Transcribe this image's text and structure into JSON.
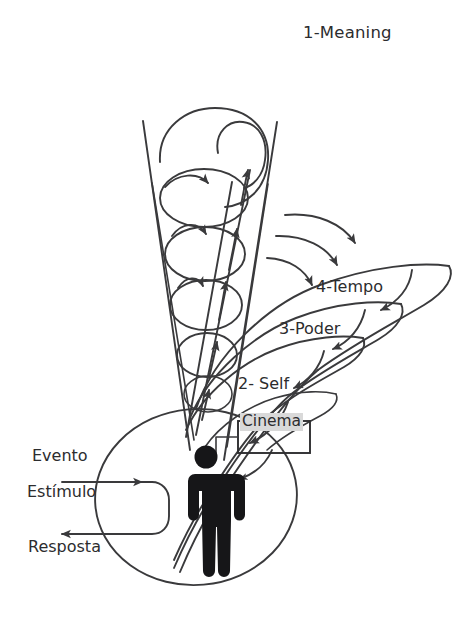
{
  "diagram": {
    "title_label": "1-Meaning",
    "background_color": "#ffffff",
    "ink_color": "#3a3a3c",
    "highlight_color": "#d9d9d9",
    "layers": [
      {
        "id": "meaning",
        "label": "1-Meaning"
      },
      {
        "id": "self",
        "label": "2- Self"
      },
      {
        "id": "poder",
        "label": "3-Poder"
      },
      {
        "id": "tempo",
        "label": "4-Tempo"
      }
    ],
    "box": {
      "label": "Cinema",
      "highlighted": true
    },
    "flow": {
      "input_top_label": "Evento",
      "input_label": "Estímulo",
      "output_label": "Resposta"
    },
    "figure": {
      "name": "person-pictogram"
    }
  }
}
